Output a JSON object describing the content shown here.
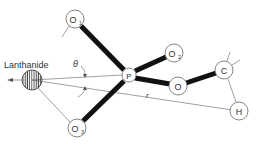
{
  "diagram": {
    "title_label": "Lanthanide",
    "angle_label": "θ",
    "distance_label": "r",
    "atoms": {
      "lanthanide": {
        "label": "",
        "x": 32,
        "y": 80,
        "r": 10
      },
      "P": {
        "label": "P",
        "x": 129,
        "y": 75,
        "r": 7
      },
      "O1": {
        "label": "O",
        "sub": "1",
        "x": 75,
        "y": 19,
        "r": 9
      },
      "O2": {
        "label": "O",
        "sub": "2",
        "x": 174,
        "y": 53,
        "r": 9
      },
      "O3": {
        "label": "O",
        "sub": "3",
        "x": 77,
        "y": 128,
        "r": 9
      },
      "O": {
        "label": "O",
        "x": 178,
        "y": 86,
        "r": 9
      },
      "C": {
        "label": "C",
        "x": 224,
        "y": 70,
        "r": 9
      },
      "H": {
        "label": "H",
        "x": 239,
        "y": 111,
        "r": 9
      }
    },
    "bonds_thick": [
      "O1-P",
      "P-O3",
      "P-O2",
      "P-O",
      "O-C"
    ],
    "lines_thin": [
      "Lanthanide-P",
      "Lanthanide-O3",
      "Lanthanide-H (r)",
      "C-H",
      "O1-tail",
      "C-ticks"
    ]
  }
}
